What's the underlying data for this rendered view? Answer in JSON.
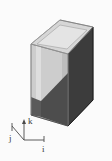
{
  "figure": {
    "background_color": "#fbfbfb",
    "solid": {
      "name": "hexagonal prism",
      "description": "Shaded 3D hexagonal prism viewed in oblique projection",
      "faces": [
        {
          "name": "top-face",
          "shading": "light",
          "color": "#d7d7d7",
          "points": "32,44 60,20 93,27 68,54"
        },
        {
          "name": "top-face-inner",
          "shading": "lighter",
          "color": "#e3e3e3",
          "points": "36,44 60,24 89,29 67,50"
        },
        {
          "name": "left-face-upper",
          "shading": "light",
          "color": "#cfcfcf",
          "points": "32,44 68,54 68,108 32,97"
        },
        {
          "name": "left-face-lower",
          "shading": "light-mid",
          "color": "#c4c4c4",
          "points": "32,97 68,108 68,126 32,115"
        },
        {
          "name": "right-face",
          "shading": "dark",
          "color": "#3c3c3c",
          "points": "68,54 93,27 93,100 68,126"
        },
        {
          "name": "front-face-lower-dark",
          "shading": "dark-mid",
          "color": "#4a4a4a",
          "points": "46,100 93,62 93,100 68,126 46,118"
        }
      ],
      "colors": {
        "light": "#d7d7d7",
        "lighter": "#e3e3e3",
        "mid": "#c4c4c4",
        "dark": "#3c3c3c",
        "dark_mid": "#4a4a4a",
        "edge": "#8a8a8a",
        "edge_dark": "#262626"
      }
    },
    "axis_triad": {
      "name": "coordinate-triad",
      "origin_x": 24,
      "origin_y": 140,
      "axes": [
        {
          "label": "i",
          "direction": "right",
          "tip_x": 44,
          "tip_y": 140
        },
        {
          "label": "j",
          "direction": "up-left",
          "tip_x": 12,
          "tip_y": 124
        },
        {
          "label": "k",
          "direction": "up",
          "tip_x": 24,
          "tip_y": 120
        }
      ],
      "label_color": "#3a3a3a"
    }
  }
}
